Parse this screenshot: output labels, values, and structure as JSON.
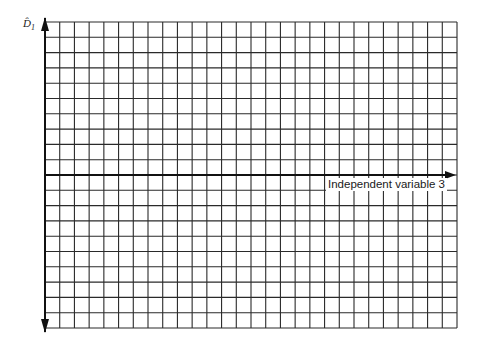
{
  "chart_data": {
    "type": "line",
    "title": "",
    "xlabel": "Independent variable 3",
    "ylabel": "D̂",
    "ylabel_subscript": "1",
    "series": [],
    "grid": true,
    "grid_columns": 28,
    "grid_rows": 20,
    "x_axis_row_from_top": 10,
    "axis_arrows": [
      "y-up",
      "y-down",
      "x-right"
    ],
    "tick_labels": {
      "x": [],
      "y": []
    },
    "note": "Blank graph-paper grid with axes; no data plotted"
  },
  "colors": {
    "grid": "#2a2a2a",
    "axis": "#111111",
    "background": "#ffffff"
  }
}
